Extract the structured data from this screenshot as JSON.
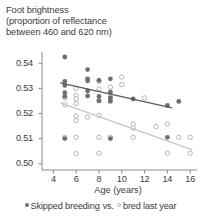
{
  "chart_data": {
    "type": "scatter",
    "title": "Foot brightness (proportion of reflectance between 460 and 620 nm)",
    "title_lines": [
      "Foot brightness",
      "(proportion of reflectance",
      "between 460 and 620 nm)"
    ],
    "xlabel": "Age (years)",
    "ylabel": "",
    "xlim": [
      3,
      16.6
    ],
    "ylim": [
      0.4975,
      0.5445
    ],
    "xticks": [
      4,
      6,
      8,
      10,
      12,
      14,
      16
    ],
    "xtick_labels": [
      "4",
      "6",
      "8",
      "10",
      "12",
      "14",
      "16"
    ],
    "yticks": [
      0.5,
      0.51,
      0.52,
      0.53,
      0.54
    ],
    "ytick_labels": [
      "0.50",
      "0.51",
      "0.52",
      "0.53",
      "0.54"
    ],
    "grid": false,
    "legend_position": "below",
    "legend_separator": "vs.",
    "colors": {
      "skipped_marker": "#6e6e6e",
      "skipped_line": "#5a5a5a",
      "bred_marker": "#b6b6b6",
      "bred_line": "#c6c6c6",
      "axis": "#8c8c8c",
      "text": "#3c3c3c"
    },
    "series": [
      {
        "name": "Skipped breeding",
        "marker": "filled-circle",
        "color": "#6e6e6e",
        "points": [
          [
            5,
            0.5425
          ],
          [
            5,
            0.5328
          ],
          [
            5,
            0.5312
          ],
          [
            5,
            0.5283
          ],
          [
            5,
            0.5268
          ],
          [
            5,
            0.51
          ],
          [
            7,
            0.5375
          ],
          [
            7,
            0.5338
          ],
          [
            7,
            0.533
          ],
          [
            7,
            0.529
          ],
          [
            7,
            0.527
          ],
          [
            8,
            0.5332
          ],
          [
            8,
            0.5268
          ],
          [
            8,
            0.525
          ],
          [
            9,
            0.5338
          ],
          [
            9,
            0.5285
          ],
          [
            9,
            0.5262
          ],
          [
            9,
            0.525
          ],
          [
            9,
            0.51
          ],
          [
            11,
            0.5258
          ],
          [
            14,
            0.5232
          ],
          [
            14,
            0.5105
          ],
          [
            15,
            0.5248
          ]
        ]
      },
      {
        "name": "bred last year",
        "marker": "open-circle",
        "color": "#b6b6b6",
        "points": [
          [
            5,
            0.5262
          ],
          [
            5,
            0.5235
          ],
          [
            5,
            0.5105
          ],
          [
            6,
            0.53
          ],
          [
            6,
            0.5272
          ],
          [
            6,
            0.5258
          ],
          [
            6,
            0.524
          ],
          [
            6,
            0.519
          ],
          [
            6,
            0.5172
          ],
          [
            6,
            0.5105
          ],
          [
            6,
            0.504
          ],
          [
            7,
            0.5185
          ],
          [
            8,
            0.5328
          ],
          [
            8,
            0.5298
          ],
          [
            8,
            0.5252
          ],
          [
            8,
            0.5192
          ],
          [
            8,
            0.5105
          ],
          [
            8,
            0.5042
          ],
          [
            9,
            0.5305
          ],
          [
            9,
            0.5265
          ],
          [
            9,
            0.5248
          ],
          [
            9,
            0.5105
          ],
          [
            10,
            0.5345
          ],
          [
            10,
            0.5315
          ],
          [
            11,
            0.5158
          ],
          [
            11,
            0.5142
          ],
          [
            11,
            0.5105
          ],
          [
            12,
            0.5262
          ],
          [
            13,
            0.5148
          ],
          [
            14,
            0.5158
          ],
          [
            14,
            0.5042
          ],
          [
            15,
            0.5105
          ],
          [
            16,
            0.5105
          ],
          [
            16,
            0.5042
          ]
        ]
      }
    ],
    "trendlines": [
      {
        "name": "Skipped breeding",
        "color": "#5a5a5a",
        "x0": 4.6,
        "y0": 0.5322,
        "x1": 14.4,
        "y1": 0.5222
      },
      {
        "name": "bred last year",
        "color": "#c6c6c6",
        "x0": 4.6,
        "y0": 0.5242,
        "x1": 16.2,
        "y1": 0.5055
      }
    ]
  },
  "legend": {
    "skipped_label": "Skipped breeding",
    "separator": "vs.",
    "bred_label": "bred last year"
  }
}
